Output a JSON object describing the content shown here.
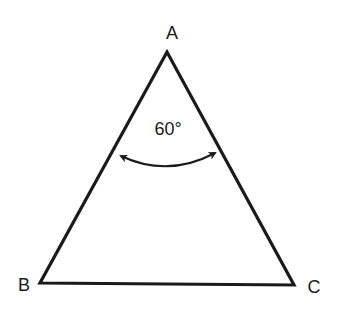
{
  "diagram": {
    "type": "triangle",
    "vertices": {
      "A": {
        "label": "A",
        "x": 167,
        "y": 52
      },
      "B": {
        "label": "B",
        "x": 40,
        "y": 283
      },
      "C": {
        "label": "C",
        "x": 294,
        "y": 285
      }
    },
    "angle_annotation": {
      "vertex": "A",
      "text": "60°"
    },
    "colors": {
      "stroke": "#1a1a1a",
      "background": "#ffffff"
    }
  }
}
